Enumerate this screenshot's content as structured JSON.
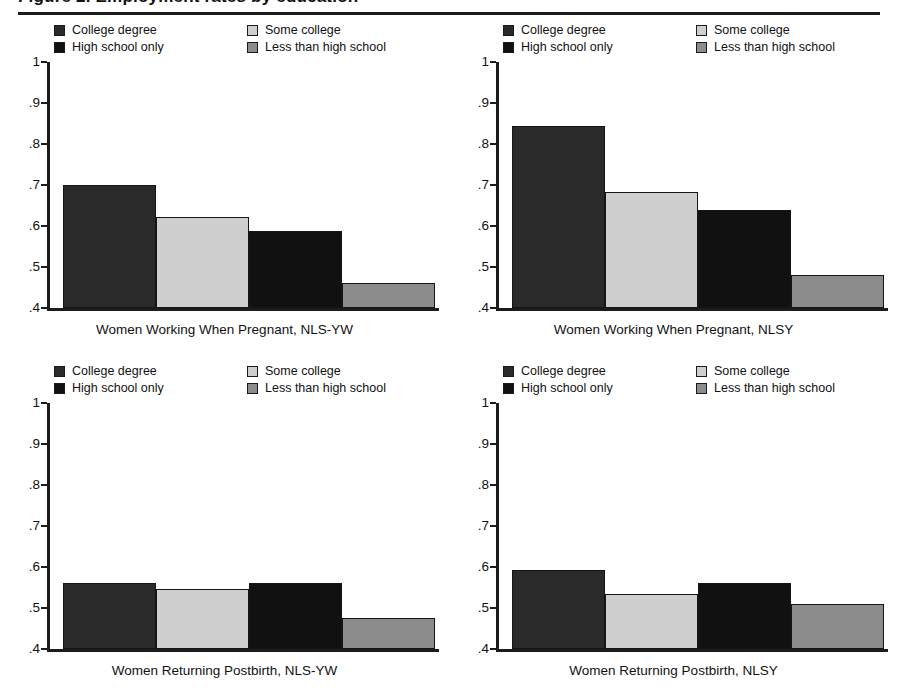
{
  "figure": {
    "title": "Figure 2. Employment rates by education",
    "title_visible_fragment": "(clipped)"
  },
  "colors": {
    "college_degree": "#2a2a2a",
    "high_school_only": "#111111",
    "some_college": "#cfcfcf",
    "less_than_high_school": "#8c8c8c",
    "axis": "#1c1c1c",
    "background": "#ffffff"
  },
  "legend": {
    "items": [
      {
        "label": "College degree",
        "key": "college_degree",
        "column": 0,
        "row": 0
      },
      {
        "label": "High school only",
        "key": "high_school_only",
        "column": 0,
        "row": 1
      },
      {
        "label": "Some college",
        "key": "some_college",
        "column": 1,
        "row": 0
      },
      {
        "label": "Less than high school",
        "key": "less_than_high_school",
        "column": 1,
        "row": 1
      }
    ]
  },
  "y_axis": {
    "ticks": [
      "1",
      ".9",
      ".8",
      ".7",
      ".6",
      ".5",
      ".4"
    ],
    "values": [
      1.0,
      0.9,
      0.8,
      0.7,
      0.6,
      0.5,
      0.4
    ],
    "min": 0.4,
    "max": 1.0
  },
  "chart_data": [
    {
      "type": "bar",
      "title": "Women Working When Pregnant, NLS-YW",
      "xlabel": "Women Working When Pregnant, NLS-YW",
      "ylabel": "",
      "ylim": [
        0.4,
        1.0
      ],
      "grid": false,
      "legend_position": "top",
      "categories": [
        "College degree",
        "Some college",
        "High school only",
        "Less than high school"
      ],
      "values": [
        0.7,
        0.622,
        0.588,
        0.462
      ],
      "tick_labels": [
        "1",
        ".9",
        ".8",
        ".7",
        ".6",
        ".5",
        ".4"
      ]
    },
    {
      "type": "bar",
      "title": "Women Working When Pregnant, NLSY",
      "xlabel": "Women Working When Pregnant, NLSY",
      "ylabel": "",
      "ylim": [
        0.4,
        1.0
      ],
      "grid": false,
      "legend_position": "top",
      "categories": [
        "College degree",
        "Some college",
        "High school only",
        "Less than high school"
      ],
      "values": [
        0.845,
        0.682,
        0.64,
        0.48
      ],
      "tick_labels": [
        "1",
        ".9",
        ".8",
        ".7",
        ".6",
        ".5",
        ".4"
      ]
    },
    {
      "type": "bar",
      "title": "Women Returning Postbirth, NLS-YW",
      "xlabel": "Women Returning Postbirth, NLS-YW",
      "ylabel": "",
      "ylim": [
        0.4,
        1.0
      ],
      "grid": false,
      "legend_position": "top",
      "categories": [
        "College degree",
        "Some college",
        "High school only",
        "Less than high school"
      ],
      "values": [
        0.562,
        0.547,
        0.562,
        0.476
      ],
      "tick_labels": [
        "1",
        ".9",
        ".8",
        ".7",
        ".6",
        ".5",
        ".4"
      ]
    },
    {
      "type": "bar",
      "title": "Women Returning Postbirth, NLSY",
      "xlabel": "Women Returning Postbirth, NLSY",
      "ylabel": "",
      "ylim": [
        0.4,
        1.0
      ],
      "grid": false,
      "legend_position": "top",
      "categories": [
        "College degree",
        "Some college",
        "High school only",
        "Less than high school"
      ],
      "values": [
        0.593,
        0.535,
        0.56,
        0.51
      ],
      "tick_labels": [
        "1",
        ".9",
        ".8",
        ".7",
        ".6",
        ".5",
        ".4"
      ]
    }
  ]
}
